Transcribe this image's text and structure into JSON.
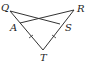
{
  "diagram": {
    "type": "geometry",
    "labels": {
      "Q": "Q",
      "R": "R",
      "A": "A",
      "S": "S",
      "T": "T"
    },
    "points": {
      "Q": [
        10,
        11
      ],
      "R": [
        74,
        10
      ],
      "A": [
        20,
        23
      ],
      "S": [
        60,
        24
      ],
      "T": [
        43,
        50
      ]
    },
    "segments": [
      [
        "Q",
        "S"
      ],
      [
        "R",
        "A"
      ],
      [
        "Q",
        "T"
      ],
      [
        "R",
        "T"
      ]
    ],
    "tick_marks": [
      {
        "segment": [
          "A",
          "T"
        ],
        "count": 1
      },
      {
        "segment": [
          "S",
          "T"
        ],
        "count": 1
      }
    ],
    "stroke_color": "#333333"
  }
}
